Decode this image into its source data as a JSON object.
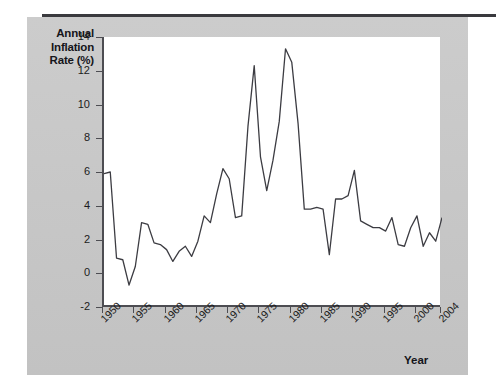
{
  "figure": {
    "y_axis_title": "Annual Inflation Rate (%)",
    "x_axis_title": "Year",
    "side_note": ""
  },
  "chart_data": {
    "type": "line",
    "title": "",
    "xlabel": "Year",
    "ylabel": "Annual Inflation Rate (%)",
    "xlim": [
      1950,
      2004
    ],
    "ylim": [
      -2,
      14
    ],
    "yticks": [
      -2,
      0,
      2,
      4,
      6,
      8,
      10,
      12,
      14
    ],
    "xticks": [
      1950,
      1955,
      1960,
      1965,
      1970,
      1975,
      1980,
      1985,
      1990,
      1995,
      2000,
      2004
    ],
    "grid": false,
    "legend": null,
    "line_color": "#3c3c42",
    "x": [
      1950,
      1951,
      1952,
      1953,
      1954,
      1955,
      1956,
      1957,
      1958,
      1959,
      1960,
      1961,
      1962,
      1963,
      1964,
      1965,
      1966,
      1967,
      1968,
      1969,
      1970,
      1971,
      1972,
      1973,
      1974,
      1975,
      1976,
      1977,
      1978,
      1979,
      1980,
      1981,
      1982,
      1983,
      1984,
      1985,
      1986,
      1987,
      1988,
      1989,
      1990,
      1991,
      1992,
      1993,
      1994,
      1995,
      1996,
      1997,
      1998,
      1999,
      2000,
      2001,
      2002,
      2003,
      2004
    ],
    "values": [
      5.9,
      6.0,
      0.9,
      0.8,
      -0.7,
      0.4,
      3.0,
      2.9,
      1.8,
      1.7,
      1.4,
      0.7,
      1.3,
      1.6,
      1.0,
      1.9,
      3.4,
      3.0,
      4.7,
      6.2,
      5.6,
      3.3,
      3.4,
      8.7,
      12.3,
      6.9,
      4.9,
      6.7,
      9.0,
      13.3,
      12.5,
      8.9,
      3.8,
      3.8,
      3.9,
      3.8,
      1.1,
      4.4,
      4.4,
      4.6,
      6.1,
      3.1,
      2.9,
      2.7,
      2.7,
      2.5,
      3.3,
      1.7,
      1.6,
      2.7,
      3.4,
      1.6,
      2.4,
      1.9,
      3.3
    ],
    "unit": "%"
  },
  "yticks": [
    {
      "label": "14",
      "value": 14
    },
    {
      "label": "12",
      "value": 12
    },
    {
      "label": "10",
      "value": 10
    },
    {
      "label": "8",
      "value": 8
    },
    {
      "label": "6",
      "value": 6
    },
    {
      "label": "4",
      "value": 4
    },
    {
      "label": "2",
      "value": 2
    },
    {
      "label": "0",
      "value": 0
    },
    {
      "label": "-2",
      "value": -2
    }
  ],
  "xticks": [
    {
      "label": "1950",
      "value": 1950
    },
    {
      "label": "1955",
      "value": 1955
    },
    {
      "label": "1960",
      "value": 1960
    },
    {
      "label": "1965",
      "value": 1965
    },
    {
      "label": "1970",
      "value": 1970
    },
    {
      "label": "1975",
      "value": 1975
    },
    {
      "label": "1980",
      "value": 1980
    },
    {
      "label": "1985",
      "value": 1985
    },
    {
      "label": "1990",
      "value": 1990
    },
    {
      "label": "1995",
      "value": 1995
    },
    {
      "label": "2000",
      "value": 2000
    },
    {
      "label": "2004",
      "value": 2004
    }
  ]
}
